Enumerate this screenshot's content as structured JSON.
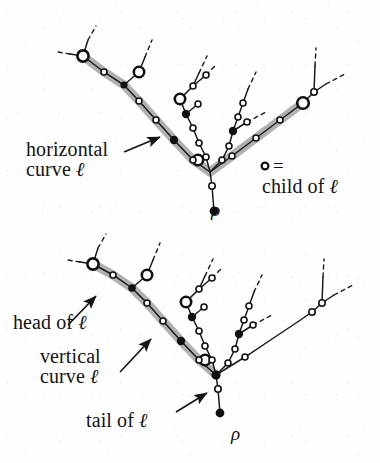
{
  "figure": {
    "kind": "two-panel tree diagram (scanned book figure)",
    "background_color": "#fefefe",
    "ink_color": "#1a1a1a",
    "highlight_color": "#a8a8a8",
    "panels": [
      {
        "id": "top",
        "highlighted_curve": "horizontal curve",
        "labels": [
          "horizontal curve ℓ",
          "child of ℓ",
          "ρ"
        ]
      },
      {
        "id": "bottom",
        "highlighted_curve": "vertical curve",
        "labels": [
          "head of ℓ",
          "vertical curve ℓ",
          "tail of ℓ",
          "ρ"
        ]
      }
    ]
  },
  "top": {
    "label_horizontal_line1": "horizontal",
    "label_horizontal_line2": "curve",
    "label_horizontal_symbol": "ℓ",
    "legend_equals": "=",
    "legend_line": "child of",
    "legend_symbol": "ℓ",
    "root_label": "ρ"
  },
  "bottom": {
    "label_head": "head of",
    "label_head_symbol": "ℓ",
    "label_vertical_line1": "vertical",
    "label_vertical_line2": "curve",
    "label_vertical_symbol": "ℓ",
    "label_tail": "tail of",
    "label_tail_symbol": "ℓ",
    "root_label": "ρ"
  }
}
